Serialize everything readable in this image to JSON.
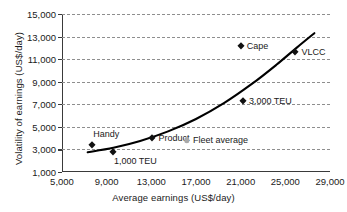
{
  "chart_data": {
    "type": "scatter",
    "title": "",
    "xlabel": "Average earnings (US$/day)",
    "ylabel": "Volatility of earnings (US$/day)",
    "xlim": [
      5000,
      29000
    ],
    "ylim": [
      1000,
      15000
    ],
    "xticks": [
      "5,000",
      "9,000",
      "13,000",
      "17,000",
      "21,000",
      "25,000",
      "29,000"
    ],
    "xtick_values": [
      5000,
      9000,
      13000,
      17000,
      21000,
      25000,
      29000
    ],
    "yticks": [
      "1,000",
      "3,000",
      "5,000",
      "7,000",
      "9,000",
      "11,000",
      "13,000",
      "15,000"
    ],
    "ytick_values": [
      1000,
      3000,
      5000,
      7000,
      9000,
      11000,
      13000,
      15000
    ],
    "grid": "horizontal-dashed",
    "legend": "none",
    "series": [
      {
        "name": "Vessel segments",
        "marker": "diamond",
        "color": "#111111",
        "points": [
          {
            "label": "Handy",
            "x": 7700,
            "y": 3400,
            "label_pos": "above"
          },
          {
            "label": "1,000 TEU",
            "x": 9600,
            "y": 2800,
            "label_pos": "below"
          },
          {
            "label": "Product",
            "x": 13100,
            "y": 4000,
            "label_pos": "right"
          },
          {
            "label": "3,000 TEU",
            "x": 21200,
            "y": 7300,
            "label_pos": "right"
          },
          {
            "label": "Cape",
            "x": 21000,
            "y": 12200,
            "label_pos": "right"
          },
          {
            "label": "VLCC",
            "x": 25900,
            "y": 11600,
            "label_pos": "right"
          }
        ]
      },
      {
        "name": "Fleet average",
        "marker": "circle",
        "color": "#a9a9a9",
        "points": [
          {
            "label": "Fleet average",
            "x": 16200,
            "y": 3800,
            "label_pos": "right"
          }
        ]
      }
    ],
    "trendline": {
      "name": "fitted curve",
      "color": "#000000",
      "x": [
        7300,
        9600,
        12000,
        14500,
        17000,
        19500,
        22000,
        24200,
        26000,
        27600
      ],
      "y": [
        2750,
        3150,
        3750,
        4600,
        5700,
        7100,
        8800,
        10500,
        12000,
        13300
      ]
    }
  }
}
